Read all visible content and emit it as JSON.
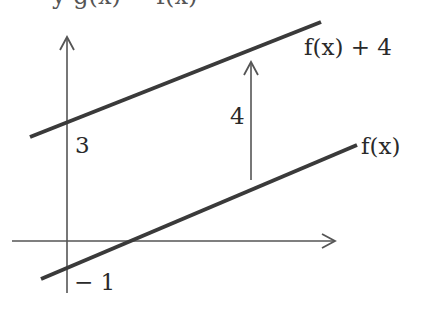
{
  "title_partial": "y  g(x) = f(x)",
  "diagram": {
    "type": "vertical-translation",
    "upper_line_label": "f(x) + 4",
    "lower_line_label": "f(x)",
    "shift_label": "4",
    "upper_intercept_label": "3",
    "lower_intercept_label": "− 1",
    "colors": {
      "lines": "#3a3a3a",
      "axes": "#555555",
      "text": "#2a2a2a"
    }
  }
}
